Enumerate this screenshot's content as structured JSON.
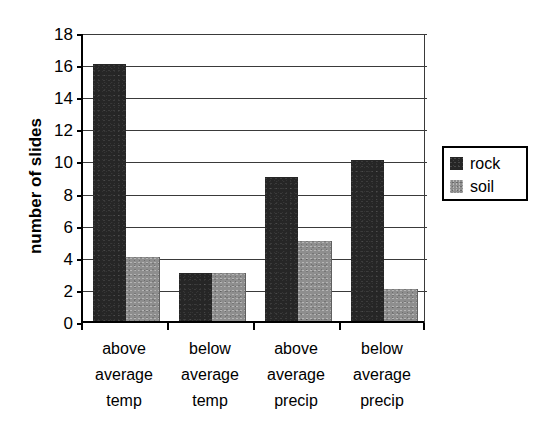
{
  "chart_data": {
    "type": "bar",
    "title": "",
    "xlabel": "",
    "ylabel": "number of slides",
    "categories": [
      "above average temp",
      "below average temp",
      "above average precip",
      "below average precip"
    ],
    "category_lines": [
      [
        "above",
        "average",
        "temp"
      ],
      [
        "below",
        "average",
        "temp"
      ],
      [
        "above",
        "average",
        "precip"
      ],
      [
        "below",
        "average",
        "precip"
      ]
    ],
    "series": [
      {
        "name": "rock",
        "color": "#262626",
        "values": [
          16,
          3,
          9,
          10
        ]
      },
      {
        "name": "soil",
        "color": "#8e8e8e",
        "values": [
          4,
          3,
          5,
          2
        ]
      }
    ],
    "ylim": [
      0,
      18
    ],
    "ytick_step": 2,
    "yticks": [
      18,
      16,
      14,
      12,
      10,
      8,
      6,
      4,
      2,
      0
    ],
    "ytick_labels": [
      "18",
      "16",
      "14",
      "12",
      "10",
      "8",
      "6",
      "4",
      "2",
      "0"
    ],
    "grid": true,
    "grid_axis": "y",
    "legend_position": "right"
  },
  "legend": {
    "entries": [
      {
        "label": "rock",
        "swatch": "rock-swatch"
      },
      {
        "label": "soil",
        "swatch": "soil-swatch"
      }
    ]
  },
  "axes": {
    "y_title": "number of slides"
  }
}
